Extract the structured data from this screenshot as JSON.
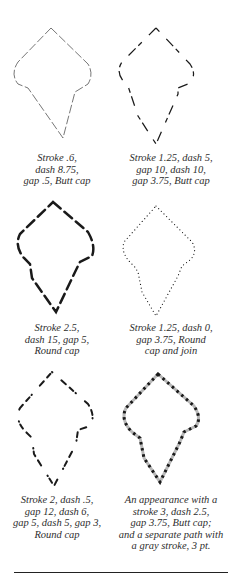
{
  "examples": [
    {
      "caption_lines": [
        "Stroke .6,",
        "dash 8.75,",
        "gap .5, Butt cap"
      ],
      "stroke_width": 0.6,
      "dasharray": "8.75 0.5",
      "linecap": "butt",
      "linejoin": "miter"
    },
    {
      "caption_lines": [
        "Stroke 1.25, dash 5,",
        "gap 10, dash 10,",
        "gap 3.75, Butt cap"
      ],
      "stroke_width": 1.25,
      "dasharray": "5 10 10 3.75",
      "linecap": "butt",
      "linejoin": "miter"
    },
    {
      "caption_lines": [
        "Stroke 2.5,",
        "dash 15, gap 5,",
        "Round cap"
      ],
      "stroke_width": 2.5,
      "dasharray": "15 5",
      "linecap": "round",
      "linejoin": "miter"
    },
    {
      "caption_lines": [
        "Stroke 1.25, dash 0,",
        "gap 3.75, Round",
        "cap and join"
      ],
      "stroke_width": 1.25,
      "dasharray": "0 3.75",
      "linecap": "round",
      "linejoin": "round"
    },
    {
      "caption_lines": [
        "Stroke 2, dash .5,",
        "gap 12, dash 6,",
        "gap 5, dash 5, gap 3,",
        "Round cap"
      ],
      "stroke_width": 2,
      "dasharray": "0.5 12 6 5 5 3",
      "linecap": "round",
      "linejoin": "miter"
    },
    {
      "caption_lines": [
        "An appearance with a",
        "stroke 3, dash 2.5,",
        "gap 3.75, Butt cap;",
        "and a separate path with",
        "a gray stroke, 3 pt."
      ],
      "stroke_width": 3,
      "dasharray": "2.5 3.75",
      "linecap": "butt",
      "linejoin": "miter",
      "underlay_color": "#b8b8b8",
      "underlay_width": 3
    }
  ],
  "colors": {
    "stroke": "#1a1a1a",
    "gray_underlay": "#b8b8b8",
    "rule": "#222222"
  }
}
